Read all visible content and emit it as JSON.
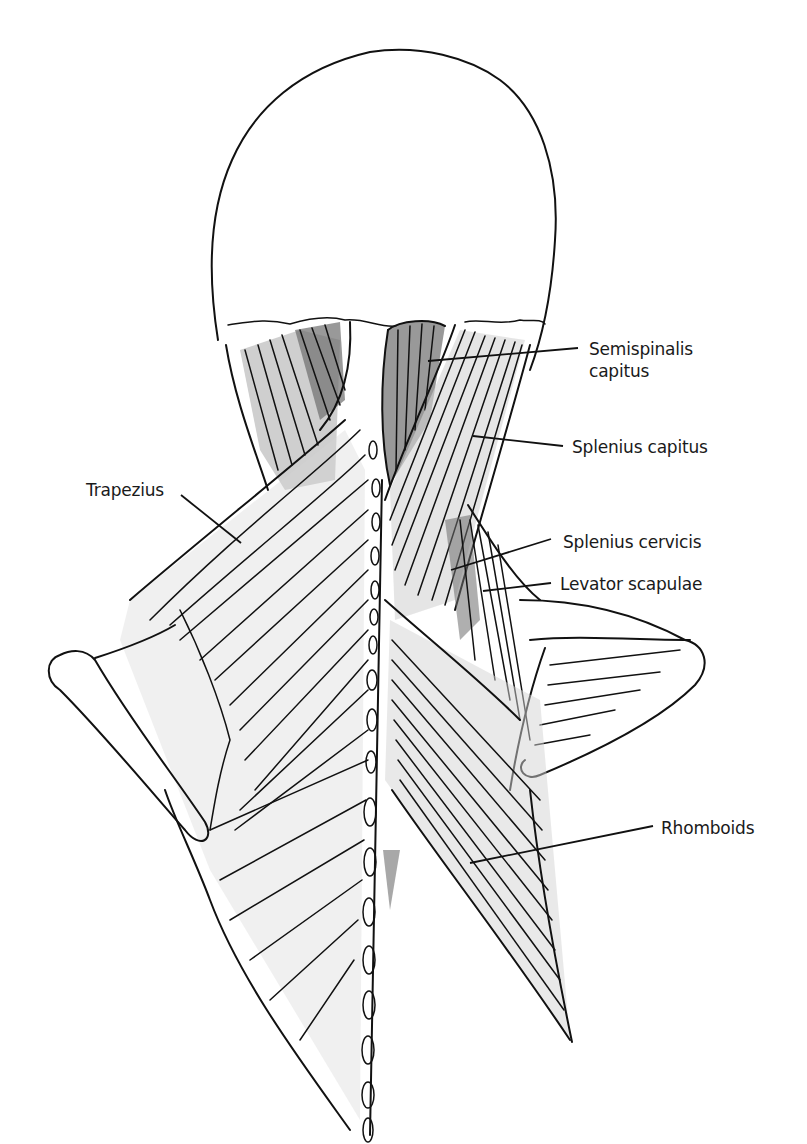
{
  "figure": {
    "labels": [
      {
        "id": "semispinalis-capitus",
        "lines": [
          "Semispinalis",
          "capitus"
        ]
      },
      {
        "id": "splenius-capitus",
        "text": "Splenius capitus"
      },
      {
        "id": "trapezius",
        "text": "Trapezius"
      },
      {
        "id": "splenius-cervicis",
        "text": "Splenius cervicis"
      },
      {
        "id": "levator-scapulae",
        "text": "Levator scapulae"
      },
      {
        "id": "rhomboids",
        "text": "Rhomboids"
      }
    ]
  }
}
